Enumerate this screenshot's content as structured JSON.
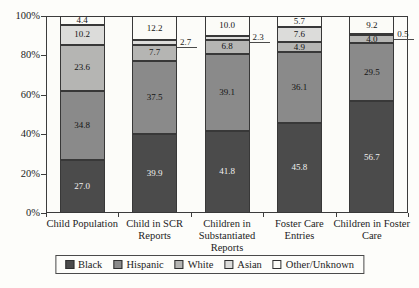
{
  "chart_data": {
    "type": "bar",
    "variant": "stacked-100-percent",
    "title": "",
    "xlabel": "",
    "ylabel": "",
    "ylim": [
      0,
      100
    ],
    "grid": false,
    "legend_position": "bottom",
    "y_ticks": [
      "0%",
      "20%",
      "40%",
      "60%",
      "80%",
      "100%"
    ],
    "categories": [
      "Child Population",
      "Child in SCR Reports",
      "Children in Substantiated Reports",
      "Foster Care Entries",
      "Children in Foster Care"
    ],
    "category_label_lines": [
      [
        "Child Population"
      ],
      [
        "Child in SCR",
        "Reports"
      ],
      [
        "Children in",
        "Substantiated",
        "Reports"
      ],
      [
        "Foster Care",
        "Entries"
      ],
      [
        "Children in Foster",
        "Care"
      ]
    ],
    "series": [
      {
        "name": "Black",
        "color": "#4b4b4b",
        "text_color": "#f2f2f0",
        "values": [
          27.0,
          39.9,
          41.8,
          45.8,
          56.7
        ]
      },
      {
        "name": "Hispanic",
        "color": "#8a8a8a",
        "text_color": "#141414",
        "values": [
          34.8,
          37.5,
          39.1,
          36.1,
          29.5
        ]
      },
      {
        "name": "White",
        "color": "#b5b5b3",
        "text_color": "#141414",
        "values": [
          23.6,
          7.7,
          6.8,
          4.9,
          4.0
        ]
      },
      {
        "name": "Asian",
        "color": "#dcdcda",
        "text_color": "#141414",
        "values": [
          10.2,
          2.7,
          2.3,
          7.6,
          0.5
        ]
      },
      {
        "name": "Other/Unknown",
        "color": "#fbfbf7",
        "text_color": "#141414",
        "values": [
          4.4,
          12.2,
          10.0,
          5.7,
          9.2
        ]
      }
    ]
  },
  "legend": {
    "items": [
      "Black",
      "Hispanic",
      "White",
      "Asian",
      "Other/Unknown"
    ]
  },
  "layout_colors": {
    "frame": "#3c3c3c",
    "background": "#fdfdfa"
  }
}
